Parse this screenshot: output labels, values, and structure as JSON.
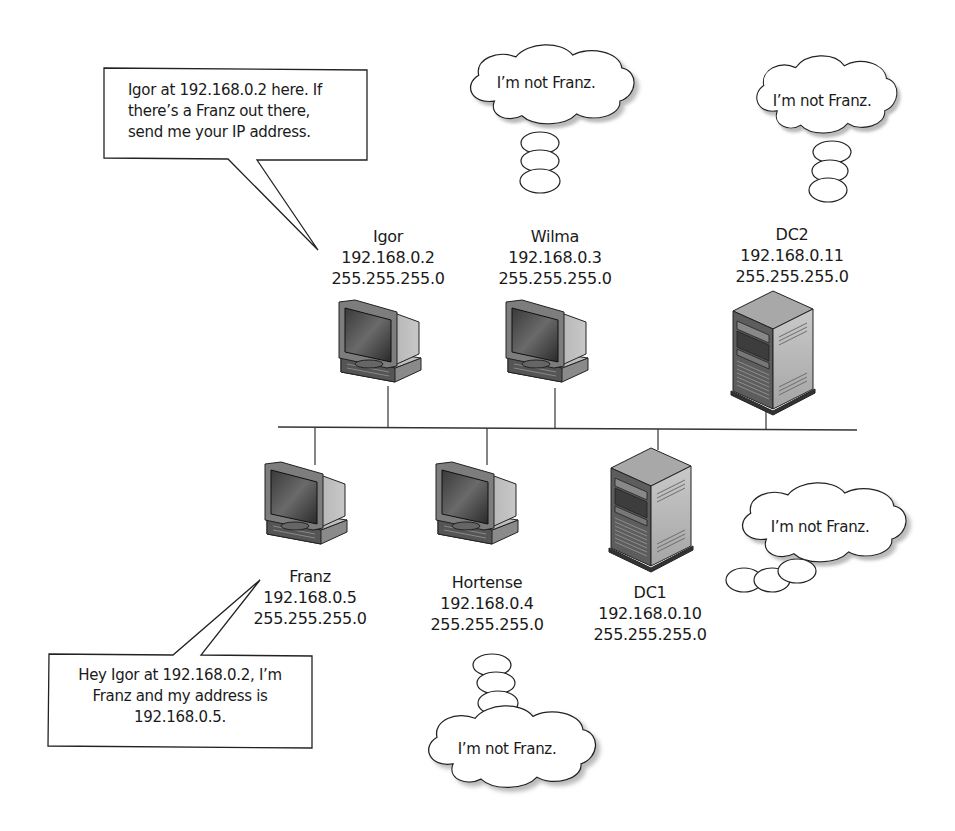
{
  "diagram": {
    "type": "network broadcast name resolution",
    "bus": {
      "color": "#333333"
    },
    "nodes": [
      {
        "id": "igor",
        "kind": "workstation",
        "name": "Igor",
        "ip": "192.168.0.2",
        "mask": "255.255.255.0"
      },
      {
        "id": "wilma",
        "kind": "workstation",
        "name": "Wilma",
        "ip": "192.168.0.3",
        "mask": "255.255.255.0"
      },
      {
        "id": "dc2",
        "kind": "server",
        "name": "DC2",
        "ip": "192.168.0.11",
        "mask": "255.255.255.0"
      },
      {
        "id": "franz",
        "kind": "workstation",
        "name": "Franz",
        "ip": "192.168.0.5",
        "mask": "255.255.255.0"
      },
      {
        "id": "hortense",
        "kind": "workstation",
        "name": "Hortense",
        "ip": "192.168.0.4",
        "mask": "255.255.255.0"
      },
      {
        "id": "dc1",
        "kind": "server",
        "name": "DC1",
        "ip": "192.168.0.10",
        "mask": "255.255.255.0"
      }
    ],
    "speech": {
      "igor": [
        "Igor at 192.168.0.2 here. If",
        "there’s a Franz out there,",
        "send me your IP address."
      ],
      "franz": [
        "Hey Igor at 192.168.0.2, I’m",
        "Franz and my address is",
        "192.168.0.5."
      ]
    },
    "thoughts": {
      "wilma": "I’m not Franz.",
      "dc2": "I’m not Franz.",
      "dc1": "I’m not Franz.",
      "hortense": "I’m not Franz."
    }
  }
}
